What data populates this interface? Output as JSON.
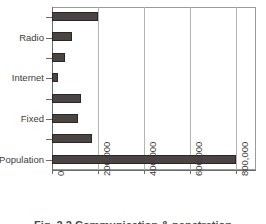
{
  "chart_data": {
    "type": "bar",
    "orientation": "horizontal",
    "title": "",
    "xlabel": "",
    "ylabel": "",
    "xlim": [
      0,
      886000
    ],
    "xticks": [
      0,
      200000,
      400000,
      600000,
      800000
    ],
    "xticklabels": [
      "0",
      "200,000",
      "400,000",
      "600,000",
      "800,000"
    ],
    "grid": "vertical",
    "legend": "none",
    "bar_color": "#4a4543",
    "bar_edge_color": "#2b2724",
    "categories": [
      "",
      "Radio",
      "",
      "Internet",
      "",
      "Fixed",
      "",
      "Population"
    ],
    "values": [
      200000,
      87000,
      57000,
      26000,
      126000,
      113000,
      174000,
      800000
    ],
    "visible_category_labels": [
      "Radio",
      "Internet",
      "Fixed",
      "Population"
    ]
  },
  "caption": {
    "text": "Fig. 2.2  Communication & penetration"
  },
  "axis": {
    "x_tick_labels": [
      "0",
      "200,000",
      "400,000",
      "600,000",
      "800,000"
    ],
    "y_tick_labels": [
      "Radio",
      "Internet",
      "Fixed",
      "Population"
    ]
  }
}
